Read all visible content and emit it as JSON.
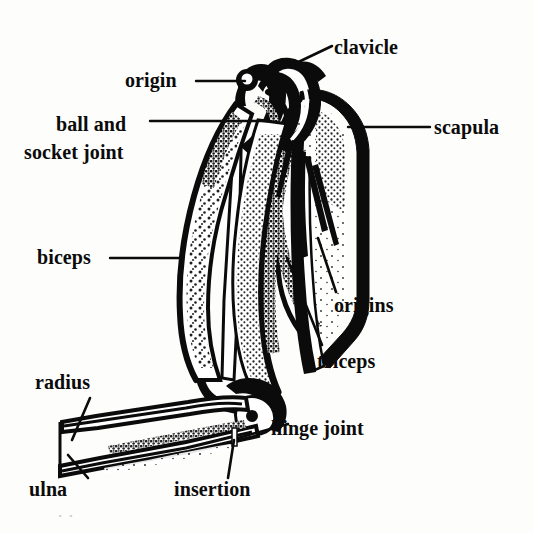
{
  "figure": {
    "style": "black ink stipple line drawing",
    "background_color": "#fdfdfb",
    "ink_color": "#0b0b0b",
    "width": 533,
    "height": 533
  },
  "labels": {
    "clavicle": "clavicle",
    "origin": "origin",
    "ball_and_socket_joint_line1": "ball and",
    "ball_and_socket_joint_line2": "socket joint",
    "scapula": "scapula",
    "biceps": "biceps",
    "origins": "origins",
    "triceps": "triceps",
    "radius": "radius",
    "hinge_joint": "hinge joint",
    "ulna": "ulna",
    "insertion": "insertion"
  },
  "artifact": {
    "scan_smudge": "·  ·"
  }
}
